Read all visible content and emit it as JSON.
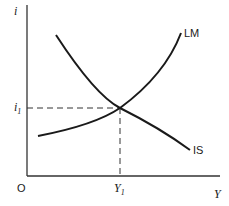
{
  "diagram": {
    "axes": {
      "y_label": "i",
      "x_label": "Y",
      "origin_label": "O"
    },
    "curves": [
      {
        "name": "LM",
        "shape": "upward-sloping"
      },
      {
        "name": "IS",
        "shape": "downward-sloping"
      }
    ],
    "equilibrium": {
      "i_label": "i",
      "i_sub": "1",
      "y_label": "Y",
      "y_sub": "1"
    },
    "colors": {
      "line": "#1a1a1a",
      "background": "#ffffff"
    }
  }
}
